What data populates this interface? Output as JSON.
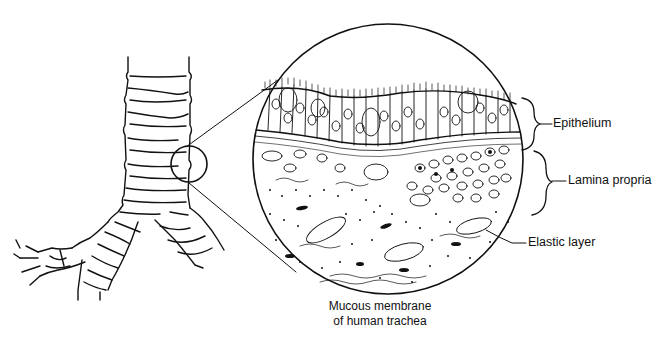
{
  "figure": {
    "caption_line1": "Mucous membrane",
    "caption_line2": "of human trachea",
    "labels": {
      "epithelium": "Epithelium",
      "lamina_propria": "Lamina propria",
      "elastic_layer": "Elastic layer"
    },
    "subjects": {
      "left": "trachea-and-bronchi",
      "right": "magnified-mucosa-cross-section"
    },
    "colors": {
      "ink": "#111111",
      "background": "#ffffff"
    }
  }
}
